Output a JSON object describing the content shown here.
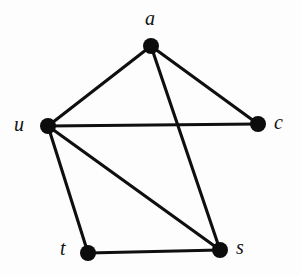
{
  "figure": {
    "kind": "undirected-graph-diagram",
    "width": 301,
    "height": 275,
    "background_color": "#fdfdfd",
    "node_color": "#0d0c0c",
    "edge_color": "#100f0f",
    "label_color": "#121111",
    "node_radius": 8,
    "edge_width": 3.1,
    "node_count": 5,
    "edge_count": 7
  },
  "chart_data": {
    "type": "diagram",
    "title": "",
    "nodes": [
      {
        "id": "a",
        "label": "a",
        "x": 151,
        "y": 46,
        "label_x": 145,
        "label_y": 8,
        "label_anchor": "above"
      },
      {
        "id": "u",
        "label": "u",
        "x": 48,
        "y": 126,
        "label_x": 14,
        "label_y": 114,
        "label_anchor": "left"
      },
      {
        "id": "c",
        "label": "c",
        "x": 258,
        "y": 124,
        "label_x": 274,
        "label_y": 112,
        "label_anchor": "right"
      },
      {
        "id": "t",
        "label": "t",
        "x": 88,
        "y": 253,
        "label_x": 60,
        "label_y": 238,
        "label_anchor": "left"
      },
      {
        "id": "s",
        "label": "s",
        "x": 220,
        "y": 250,
        "label_x": 236,
        "label_y": 237,
        "label_anchor": "right"
      }
    ],
    "edges": [
      {
        "id": "edge-a-u",
        "source": "a",
        "target": "u"
      },
      {
        "id": "edge-a-c",
        "source": "a",
        "target": "c"
      },
      {
        "id": "edge-a-s",
        "source": "a",
        "target": "s"
      },
      {
        "id": "edge-u-c",
        "source": "u",
        "target": "c"
      },
      {
        "id": "edge-u-t",
        "source": "u",
        "target": "t"
      },
      {
        "id": "edge-u-s",
        "source": "u",
        "target": "s"
      },
      {
        "id": "edge-t-s",
        "source": "t",
        "target": "s"
      }
    ],
    "crossings": [
      {
        "edges": [
          "edge-a-s",
          "edge-u-c"
        ],
        "x": 182,
        "y": 124
      }
    ]
  }
}
